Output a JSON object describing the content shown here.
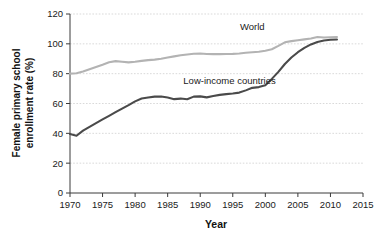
{
  "chart_data": {
    "type": "line",
    "title": "",
    "xlabel": "Year",
    "ylabel": "Female primary school enrollment rate (%)",
    "ylabel_line1": "Female primary school",
    "ylabel_line2": "enrollment rate (%)",
    "xlim": [
      1970,
      2015
    ],
    "ylim": [
      0,
      120
    ],
    "xticks": [
      1970,
      1975,
      1980,
      1985,
      1990,
      1995,
      2000,
      2005,
      2010,
      2015
    ],
    "yticks": [
      0,
      20,
      40,
      60,
      80,
      100,
      120
    ],
    "grid": "horizontal-dotted",
    "legend": "inline-annotations",
    "series": [
      {
        "name": "World",
        "color": "#b3b3b3",
        "label_x": 1998,
        "label_y": 109,
        "x": [
          1970,
          1971,
          1972,
          1973,
          1974,
          1975,
          1976,
          1977,
          1978,
          1979,
          1980,
          1981,
          1982,
          1983,
          1984,
          1985,
          1986,
          1987,
          1988,
          1989,
          1990,
          1991,
          1992,
          1993,
          1994,
          1995,
          1996,
          1997,
          1998,
          1999,
          2000,
          2001,
          2002,
          2003,
          2004,
          2005,
          2006,
          2007,
          2008,
          2009,
          2010,
          2011
        ],
        "values": [
          80.0,
          80.3,
          81.5,
          83.0,
          84.5,
          86.0,
          87.6,
          88.4,
          88.0,
          87.6,
          88.0,
          88.6,
          89.1,
          89.4,
          90.0,
          90.8,
          91.6,
          92.3,
          92.9,
          93.4,
          93.5,
          93.2,
          93.1,
          93.1,
          93.2,
          93.3,
          93.5,
          94.0,
          94.4,
          94.7,
          95.4,
          96.4,
          98.6,
          101.0,
          101.8,
          102.4,
          103.0,
          103.6,
          104.6,
          104.2,
          104.4,
          104.6
        ]
      },
      {
        "name": "Low-income countries",
        "color": "#4a4a4a",
        "label_x": 1994.5,
        "label_y": 73,
        "x": [
          1970,
          1971,
          1972,
          1973,
          1974,
          1975,
          1976,
          1977,
          1978,
          1979,
          1980,
          1981,
          1982,
          1983,
          1984,
          1985,
          1986,
          1987,
          1988,
          1989,
          1990,
          1991,
          1992,
          1993,
          1994,
          1995,
          1996,
          1997,
          1998,
          1999,
          2000,
          2001,
          2002,
          2003,
          2004,
          2005,
          2006,
          2007,
          2008,
          2009,
          2010,
          2011
        ],
        "values": [
          39.5,
          38.4,
          41.8,
          44.3,
          46.8,
          49.3,
          51.7,
          54.2,
          56.6,
          58.9,
          61.4,
          63.3,
          64.0,
          64.6,
          64.7,
          64.0,
          62.9,
          63.3,
          62.8,
          64.6,
          64.8,
          64.1,
          65.0,
          65.8,
          66.3,
          66.7,
          67.3,
          68.8,
          70.5,
          71.0,
          72.2,
          76.5,
          81.2,
          86.5,
          90.8,
          94.4,
          97.3,
          99.6,
          101.2,
          102.2,
          102.7,
          102.9
        ]
      }
    ]
  }
}
